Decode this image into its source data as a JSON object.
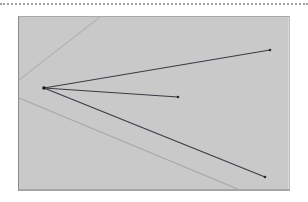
{
  "diagram": {
    "background_color": "#ffffff",
    "panel": {
      "fill": "#c9c9c9",
      "x": 18,
      "y": 16,
      "width": 272,
      "height": 175
    },
    "origin": {
      "x": 44,
      "y": 88
    },
    "rays": [
      {
        "name": "upper-ray",
        "to": {
          "x": 270,
          "y": 50
        },
        "color": "#3a3a46"
      },
      {
        "name": "middle-ray",
        "to": {
          "x": 178,
          "y": 97
        },
        "color": "#3a3a46"
      },
      {
        "name": "lower-ray",
        "to": {
          "x": 265,
          "y": 177
        },
        "color": "#3a3a46"
      }
    ],
    "guide_lines": [
      {
        "name": "upper-guide",
        "from": {
          "x": 19,
          "y": 80
        },
        "to": {
          "x": 100,
          "y": 17
        },
        "color": "#b4b4b4"
      },
      {
        "name": "lower-guide",
        "from": {
          "x": 19,
          "y": 98
        },
        "to": {
          "x": 240,
          "y": 190
        },
        "color": "#a8a8a8"
      }
    ]
  }
}
